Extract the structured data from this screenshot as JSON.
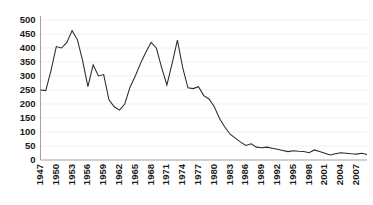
{
  "chart_data": {
    "type": "line",
    "title": "",
    "subtitle": "",
    "xlabel": "",
    "ylabel": "",
    "xlim": [
      1947,
      2009
    ],
    "ylim": [
      0,
      500
    ],
    "grid": true,
    "legend": false,
    "legend_position": "none",
    "y_ticks": [
      0,
      50,
      100,
      150,
      200,
      250,
      300,
      350,
      400,
      450,
      500
    ],
    "y_tick_labels": [
      "0",
      "50",
      "100",
      "150",
      "200",
      "250",
      "300",
      "350",
      "400",
      "450",
      "500"
    ],
    "x_ticks": [
      1947,
      1950,
      1953,
      1956,
      1959,
      1962,
      1965,
      1968,
      1971,
      1974,
      1977,
      1980,
      1983,
      1986,
      1989,
      1992,
      1995,
      1998,
      2001,
      2004,
      2007
    ],
    "x_tick_labels": [
      "1947",
      "1950",
      "1953",
      "1956",
      "1959",
      "1962",
      "1965",
      "1968",
      "1971",
      "1974",
      "1977",
      "1980",
      "1983",
      "1986",
      "1989",
      "1992",
      "1995",
      "1998",
      "2001",
      "2004",
      "2007"
    ],
    "x_tick_rotation": 90,
    "line_color": "#2b2b2b",
    "grid_color": "#e8e8e8",
    "axis_color": "#8c8c8c",
    "series": [
      {
        "name": "series-1",
        "x": [
          1947,
          1948,
          1949,
          1950,
          1951,
          1952,
          1953,
          1954,
          1955,
          1956,
          1957,
          1958,
          1959,
          1960,
          1961,
          1962,
          1963,
          1964,
          1965,
          1966,
          1967,
          1968,
          1969,
          1970,
          1971,
          1972,
          1973,
          1974,
          1975,
          1976,
          1977,
          1978,
          1979,
          1980,
          1981,
          1982,
          1983,
          1984,
          1985,
          1986,
          1987,
          1988,
          1989,
          1990,
          1991,
          1992,
          1993,
          1994,
          1995,
          1996,
          1997,
          1998,
          1999,
          2000,
          2001,
          2002,
          2003,
          2004,
          2005,
          2006,
          2007,
          2008,
          2009
        ],
        "values": [
          250,
          248,
          320,
          405,
          400,
          420,
          462,
          430,
          355,
          262,
          340,
          300,
          305,
          215,
          190,
          178,
          200,
          260,
          300,
          345,
          385,
          420,
          400,
          330,
          268,
          345,
          428,
          330,
          258,
          255,
          262,
          230,
          218,
          190,
          148,
          118,
          92,
          78,
          64,
          52,
          58,
          46,
          44,
          46,
          42,
          38,
          34,
          30,
          33,
          31,
          30,
          26,
          36,
          30,
          24,
          18,
          22,
          26,
          24,
          22,
          21,
          24,
          20
        ]
      }
    ]
  },
  "axes": {
    "y_axis_name": "y-axis",
    "x_axis_name": "x-axis"
  }
}
